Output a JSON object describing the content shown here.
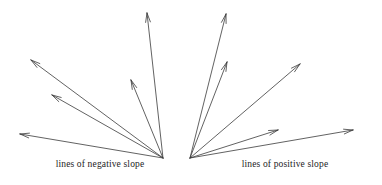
{
  "figure": {
    "width": 382,
    "height": 185,
    "background_color": "#ffffff",
    "stroke_color": "#3a3a3a",
    "text_color": "#1d1d1d",
    "stroke_width": 0.8
  },
  "captions": {
    "negative": "lines of negative slope",
    "positive": "lines of positive slope"
  },
  "chart_data": {
    "type": "scatter",
    "title": "",
    "xlabel": "",
    "ylabel": "",
    "grid": false,
    "legend": "none",
    "fans": [
      {
        "name": "negative-slope-fan",
        "label": "lines of negative slope",
        "vertex": {
          "x": 163,
          "y": 158
        },
        "rays": [
          {
            "id": "neg-ray-1",
            "tip": {
              "x": 147,
              "y": 13
            }
          },
          {
            "id": "neg-ray-2",
            "tip": {
              "x": 131,
              "y": 80
            }
          },
          {
            "id": "neg-ray-3",
            "tip": {
              "x": 31,
              "y": 60
            }
          },
          {
            "id": "neg-ray-4",
            "tip": {
              "x": 52,
              "y": 95
            }
          },
          {
            "id": "neg-ray-5",
            "tip": {
              "x": 20,
              "y": 134
            }
          }
        ]
      },
      {
        "name": "positive-slope-fan",
        "label": "lines of positive slope",
        "vertex": {
          "x": 190,
          "y": 158
        },
        "rays": [
          {
            "id": "pos-ray-1",
            "tip": {
              "x": 226,
              "y": 14
            }
          },
          {
            "id": "pos-ray-2",
            "tip": {
              "x": 227,
              "y": 62
            }
          },
          {
            "id": "pos-ray-3",
            "tip": {
              "x": 300,
              "y": 64
            }
          },
          {
            "id": "pos-ray-4",
            "tip": {
              "x": 278,
              "y": 130
            }
          },
          {
            "id": "pos-ray-5",
            "tip": {
              "x": 353,
              "y": 130
            }
          }
        ]
      }
    ]
  }
}
